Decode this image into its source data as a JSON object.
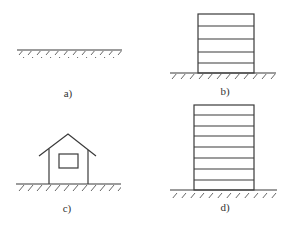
{
  "figure": {
    "panels": [
      {
        "id": "a",
        "label": "a)",
        "description": "ground line only (empty site)"
      },
      {
        "id": "b",
        "label": "b)",
        "description": "low multi-storey building on ground, 5 storeys"
      },
      {
        "id": "c",
        "label": "c)",
        "description": "small house with gable roof and window on ground"
      },
      {
        "id": "d",
        "label": "d)",
        "description": "taller multi-storey building on ground, 8 storeys"
      }
    ],
    "colors": {
      "line": "#3a3a3a",
      "background": "#ffffff"
    }
  }
}
